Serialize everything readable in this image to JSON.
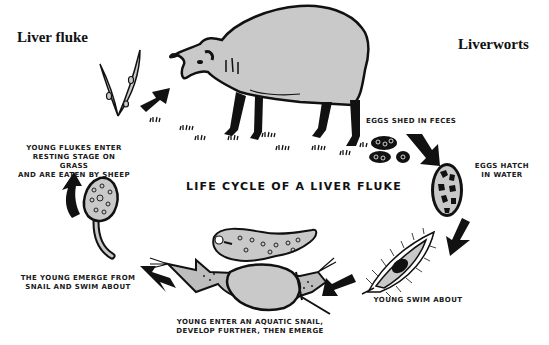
{
  "diagram": {
    "title": "LIFE CYCLE OF A LIVER FLUKE",
    "corner_labels": {
      "left": "Liver fluke",
      "right": "Liverworts"
    },
    "stages": [
      {
        "id": "sheep",
        "illustration": "sheep-grazing",
        "caption": ""
      },
      {
        "id": "eggs-shed",
        "illustration": "eggs-in-feces",
        "caption": "EGGS SHED IN FECES"
      },
      {
        "id": "eggs-hatch",
        "illustration": "egg-cell",
        "caption_lines": [
          "EGGS HATCH",
          "IN WATER"
        ]
      },
      {
        "id": "young-swim",
        "illustration": "ciliated-miracidium",
        "caption": "YOUNG SWIM ABOUT"
      },
      {
        "id": "snail",
        "illustration": "aquatic-snail-and-sporocyst",
        "caption_lines": [
          "YOUNG ENTER AN AQUATIC SNAIL,",
          "DEVELOP FURTHER, THEN EMERGE"
        ]
      },
      {
        "id": "cercaria",
        "illustration": "tailed-cercaria",
        "caption_lines": [
          "THE YOUNG EMERGE FROM",
          "SNAIL AND SWIM ABOUT"
        ]
      },
      {
        "id": "grass",
        "illustration": "grass-blades-with-cysts",
        "caption_lines": [
          "YOUNG FLUKES ENTER",
          "RESTING STAGE ON GRASS",
          "AND ARE EATEN BY SHEEP"
        ]
      }
    ],
    "arrows": [
      {
        "from": "grass",
        "to": "sheep"
      },
      {
        "from": "eggs-shed",
        "to": "eggs-hatch"
      },
      {
        "from": "eggs-hatch",
        "to": "young-swim"
      },
      {
        "from": "young-swim",
        "to": "snail"
      },
      {
        "from": "snail",
        "to": "cercaria"
      },
      {
        "from": "cercaria",
        "to": "grass"
      }
    ],
    "colors": {
      "ink": "#111111",
      "fill_gray": "#c8c8c8",
      "background": "#ffffff"
    }
  }
}
